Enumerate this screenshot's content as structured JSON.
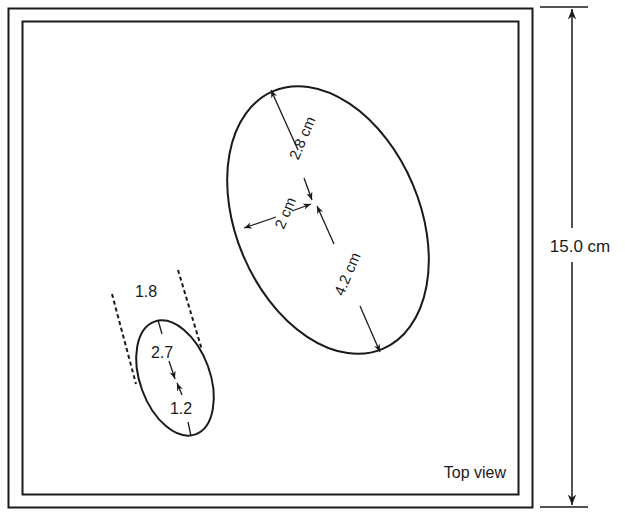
{
  "diagram": {
    "view_label": "Top view",
    "height_dimension": "15.0 cm",
    "large_ellipse": {
      "upper_semi_axis": "2.8 cm",
      "minor_semi_axis": "2 cm",
      "lower_semi_axis": "4.2 cm"
    },
    "small_ellipse": {
      "width": "1.8",
      "upper_segment": "2.7",
      "lower_segment": "1.2"
    }
  },
  "colors": {
    "stroke": "#1a1a1a",
    "background": "#ffffff"
  }
}
